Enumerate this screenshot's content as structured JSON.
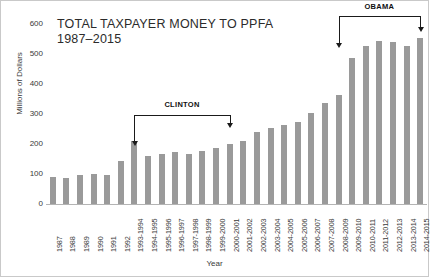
{
  "chart_data": {
    "type": "bar",
    "title": "TOTAL TAXPAYER MONEY TO PPFA",
    "subtitle": "1987–2015",
    "xlabel": "Year",
    "ylabel": "Millions of Dollars",
    "ylim": [
      0,
      600
    ],
    "yticks": [
      0,
      100,
      200,
      300,
      400,
      500,
      600
    ],
    "ytick_labels": [
      "0",
      "100",
      "200",
      "300",
      "400",
      "500",
      "600"
    ],
    "grid": false,
    "legend": "none",
    "bar_color": "#9a9a9a",
    "categories": [
      "1987",
      "1988",
      "1989",
      "1990",
      "1991",
      "1992",
      "1993-1994",
      "1994-1995",
      "1995-1996",
      "1996-1997",
      "1997-1998",
      "1998-1999",
      "1999-2000",
      "2000-2001",
      "2001-2002",
      "2002-2003",
      "2003-2004",
      "2004-2005",
      "2005-2006",
      "2006-2007",
      "2007-2008",
      "2008-2009",
      "2009-2010",
      "2010-2011",
      "2011-2012",
      "2012-2013",
      "2013-2014",
      "2014-2015"
    ],
    "values": [
      90,
      87,
      97,
      100,
      98,
      145,
      210,
      160,
      168,
      175,
      166,
      178,
      187,
      199,
      211,
      240,
      254,
      265,
      273,
      305,
      336,
      363,
      487,
      528,
      542,
      540,
      528,
      553
    ],
    "annotations": [
      {
        "label": "CLINTON",
        "start_category": "1993-1994",
        "end_category": "2000-2001"
      },
      {
        "label": "OBAMA",
        "start_category": "2008-2009",
        "end_category": "2014-2015"
      }
    ]
  }
}
